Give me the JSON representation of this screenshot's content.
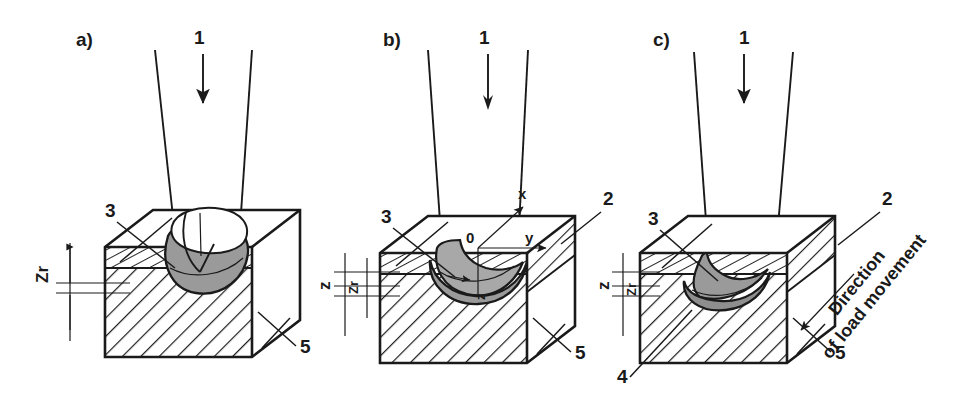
{
  "figure": {
    "background": "#ffffff",
    "ink_color": "#1a1a1a",
    "indent_fill_color": "#9a9a9a",
    "indent_fill_color_light": "#b4b4b4"
  },
  "panels": [
    {
      "id": "a",
      "label": "a)",
      "callouts": [
        {
          "key": "load",
          "text": "1"
        },
        {
          "key": "layer",
          "text": "3"
        },
        {
          "key": "substrate",
          "text": "5"
        }
      ],
      "dimensions": [
        {
          "key": "zr",
          "text": "Zr",
          "base": "Z",
          "sub": "r",
          "rotated": true
        }
      ]
    },
    {
      "id": "b",
      "label": "b)",
      "callouts": [
        {
          "key": "load",
          "text": "1"
        },
        {
          "key": "edge",
          "text": "2"
        },
        {
          "key": "layer",
          "text": "3"
        },
        {
          "key": "substrate",
          "text": "5"
        }
      ],
      "axes": [
        {
          "key": "origin",
          "text": "0"
        },
        {
          "key": "x-axis",
          "text": "x"
        },
        {
          "key": "y-axis",
          "text": "y"
        },
        {
          "key": "z-axis",
          "text": "z"
        }
      ],
      "dimensions": [
        {
          "key": "z",
          "text": "z",
          "base": "z",
          "sub": "",
          "rotated": true
        },
        {
          "key": "zr",
          "text": "Zr",
          "base": "Z",
          "sub": "r",
          "rotated": true
        }
      ]
    },
    {
      "id": "c",
      "label": "c)",
      "callouts": [
        {
          "key": "load",
          "text": "1"
        },
        {
          "key": "edge",
          "text": "2"
        },
        {
          "key": "layer",
          "text": "3"
        },
        {
          "key": "crack",
          "text": "4"
        },
        {
          "key": "substrate",
          "text": "5"
        }
      ],
      "dimensions": [
        {
          "key": "z",
          "text": "z",
          "base": "z",
          "sub": "",
          "rotated": true
        },
        {
          "key": "zr",
          "text": "Zr",
          "base": "Z",
          "sub": "r",
          "rotated": true
        }
      ],
      "annotation": {
        "key": "direction-of-load-movement",
        "line1": "Direction",
        "line2": "of load movement"
      }
    }
  ]
}
